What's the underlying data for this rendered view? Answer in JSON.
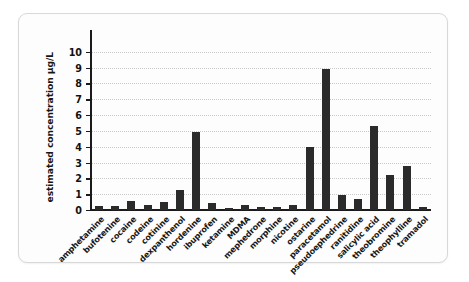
{
  "chart_data": {
    "type": "bar",
    "title": "",
    "xlabel": "",
    "ylabel": "estimated concentration µg/L",
    "ylim": [
      0,
      10.8
    ],
    "ytick_labels": [
      "0",
      "1",
      "2",
      "3",
      "4",
      "5",
      "6",
      "7",
      "8",
      "9",
      "10"
    ],
    "ytick_values": [
      0,
      1,
      2,
      3,
      4,
      5,
      6,
      7,
      8,
      9,
      10
    ],
    "grid": true,
    "grid_style": "dotted-horizontal",
    "legend": null,
    "bar_color": "#2b2b2b",
    "categories": [
      "amphetamine",
      "bufotenine",
      "cocaine",
      "codeine",
      "cotinine",
      "dexpanthenol",
      "hordenine",
      "ibuprofen",
      "ketamine",
      "MDMA",
      "mephedrone",
      "morphine",
      "nicotine",
      "ostarine",
      "paracetamol",
      "pseudoephedrine",
      "ranitidine",
      "salicylic acid",
      "theobromine",
      "theophylline",
      "tramadol"
    ],
    "values": [
      0.27,
      0.25,
      0.55,
      0.33,
      0.48,
      1.25,
      4.95,
      0.42,
      0.15,
      0.33,
      0.17,
      0.17,
      0.3,
      3.95,
      8.92,
      0.95,
      0.7,
      5.3,
      2.2,
      2.77,
      0.17
    ]
  }
}
